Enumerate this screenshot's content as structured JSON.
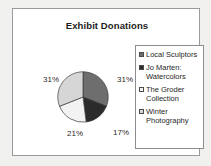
{
  "chart_data": {
    "type": "pie",
    "title": "Exhibit Donations",
    "categories": [
      "Local Sculptors",
      "Jo Marten: Watercolors",
      "The Groder Collection",
      "Winter Photography"
    ],
    "values": [
      31,
      17,
      21,
      31
    ],
    "value_labels": [
      "31%",
      "17%",
      "21%",
      "31%"
    ],
    "unit": "%",
    "legend_position": "right",
    "grid": false,
    "slice_colors": [
      "#6e6e6e",
      "#2b2b2b",
      "#f2f2f2",
      "#d6d6d6"
    ],
    "slice_border_color": "#3a3a3a",
    "slices": [
      {
        "label": "Local Sculptors",
        "value": 31,
        "value_label": "31%",
        "color": "#6e6e6e"
      },
      {
        "label": "Jo Marten: Watercolors",
        "value": 17,
        "value_label": "17%",
        "color": "#2b2b2b"
      },
      {
        "label": "The Groder Collection",
        "value": 21,
        "value_label": "21%",
        "color": "#f2f2f2"
      },
      {
        "label": "Winter Photography",
        "value": 31,
        "value_label": "31%",
        "color": "#d6d6d6"
      }
    ]
  },
  "chart": {
    "title": "Exhibit Donations",
    "frame_border_color": "#9a9a9a",
    "background_color": "#ffffff",
    "page_background_color": "#f0f0ee"
  },
  "legend": {
    "border_color": "#8d8d8d",
    "items": [
      {
        "label": "Local Sculptors",
        "color": "#6e6e6e"
      },
      {
        "label": "Jo Marten: Watercolors",
        "color": "#2b2b2b"
      },
      {
        "label": "The Groder Collection",
        "color": "#f2f2f2"
      },
      {
        "label": "Winter Photography",
        "color": "#d6d6d6"
      }
    ]
  },
  "labels": {
    "slice_0": "31%",
    "slice_1": "17%",
    "slice_2": "21%",
    "slice_3": "31%"
  }
}
